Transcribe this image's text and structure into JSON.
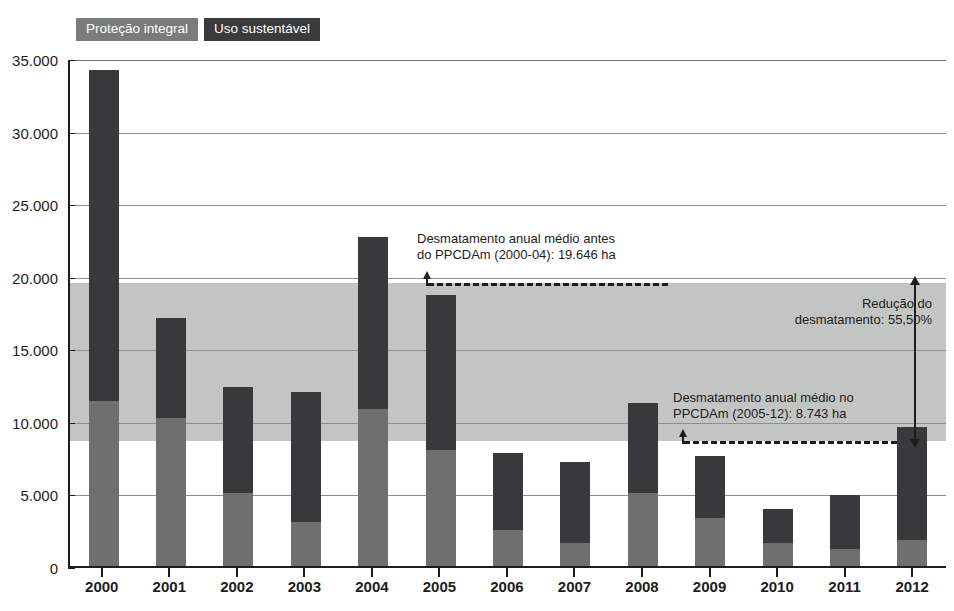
{
  "legend": {
    "items": [
      {
        "label": "Proteção integral",
        "color": "#7a7b7b",
        "name": "legend-protecao-integral"
      },
      {
        "label": "Uso sustentável",
        "color": "#3a3b3c",
        "name": "legend-uso-sustentavel"
      }
    ]
  },
  "annotations": {
    "before_line1": "Desmatamento anual médio antes",
    "before_line2": "do PPCDAm (2000-04): 19.646 ha",
    "after_line1": "Desmatamento anual médio no",
    "after_line2": "PPCDAm (2005-12): 8.743 ha",
    "reduction_line1": "Redução do",
    "reduction_line2": "desmatamento: 55,50%"
  },
  "caption": "",
  "chart_data": {
    "type": "bar",
    "title": "",
    "subtitle": "",
    "xlabel": "",
    "ylabel": "",
    "stacked": true,
    "grid": true,
    "legend_position": "top-left",
    "ylim": [
      0,
      35000
    ],
    "ytick_values": [
      0,
      5000,
      10000,
      15000,
      20000,
      25000,
      30000,
      35000
    ],
    "ytick_labels": [
      "0",
      "5.000",
      "10.000",
      "15.000",
      "20.000",
      "25.000",
      "30.000",
      "35.000"
    ],
    "categories": [
      "2000",
      "2001",
      "2002",
      "2003",
      "2004",
      "2005",
      "2006",
      "2007",
      "2008",
      "2009",
      "2010",
      "2011",
      "2012"
    ],
    "series": [
      {
        "name": "Proteção integral",
        "color": "#6e6f6f",
        "values": [
          11400,
          10200,
          5000,
          3000,
          10800,
          8000,
          2500,
          1600,
          5000,
          3300,
          1600,
          1200,
          1800
        ]
      },
      {
        "name": "Uso sustentável",
        "color": "#38393a",
        "values": [
          22800,
          6900,
          7300,
          9000,
          11900,
          10700,
          5300,
          5600,
          6200,
          4300,
          2300,
          3700,
          7800
        ]
      }
    ],
    "totals": [
      34200,
      17100,
      12300,
      12000,
      22700,
      18700,
      7800,
      7200,
      11200,
      7600,
      3900,
      4900,
      9600
    ],
    "reference_lines": [
      {
        "label": "Desmatamento anual médio antes do PPCDAm (2000-04)",
        "value": 19646,
        "unit": "ha",
        "style": "dashed"
      },
      {
        "label": "Desmatamento anual médio no PPCDAm (2005-12)",
        "value": 8743,
        "unit": "ha",
        "style": "dashed"
      }
    ],
    "band": {
      "from": 8743,
      "to": 19646,
      "label": "Redução do desmatamento: 55,50%",
      "reduction_pct": 55.5,
      "color": "#c3c4c4"
    }
  }
}
